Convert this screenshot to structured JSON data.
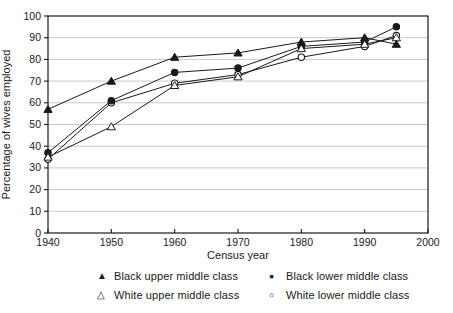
{
  "chart_data": {
    "type": "line",
    "title": "",
    "xlabel": "Census year",
    "ylabel": "Percentage of wives employed",
    "x": [
      1940,
      1950,
      1960,
      1970,
      1980,
      1990,
      1995
    ],
    "xlim": [
      1940,
      2000
    ],
    "xticks": [
      1940,
      1950,
      1960,
      1970,
      1980,
      1990,
      2000
    ],
    "ylim": [
      0,
      100
    ],
    "yticks": [
      0,
      10,
      20,
      30,
      40,
      50,
      60,
      70,
      80,
      90,
      100
    ],
    "grid": "horizontal",
    "legend_position": "bottom",
    "series": [
      {
        "name": "Black upper middle class",
        "marker": "triangle-filled",
        "glyph": "▲",
        "values": [
          57,
          70,
          81,
          83,
          88,
          90,
          87
        ]
      },
      {
        "name": "White upper middle class",
        "marker": "triangle-open",
        "glyph": "△",
        "values": [
          35,
          49,
          68,
          72,
          85,
          87,
          90
        ]
      },
      {
        "name": "Black lower middle class",
        "marker": "circle-filled",
        "glyph": "●",
        "values": [
          37,
          61,
          74,
          76,
          86,
          88,
          95
        ]
      },
      {
        "name": "White lower middle class",
        "marker": "circle-open",
        "glyph": "○",
        "values": [
          34,
          60,
          69,
          73,
          81,
          86,
          91
        ]
      }
    ],
    "colors": {
      "line": "#1a1a1a",
      "grid": "#c3c3c3",
      "text": "#1a1a1a",
      "background": "#ffffff"
    }
  }
}
